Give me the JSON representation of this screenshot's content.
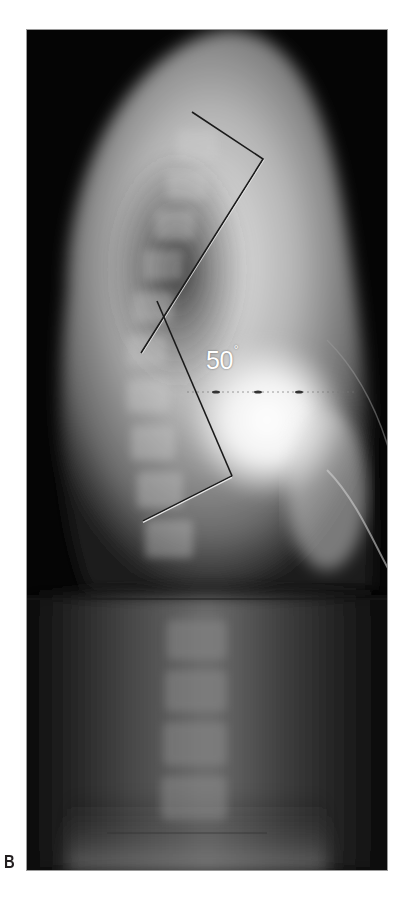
{
  "figure": {
    "panel_label": "B",
    "image_type": "lateral spine radiograph",
    "annotation": {
      "angle_value": "50",
      "angle_unit": "°",
      "measurement": "Cobb angle (kyphosis)"
    },
    "colors": {
      "background": "#ffffff",
      "film": "#050505",
      "measure_line_dark": "#1a1a1a",
      "measure_line_light": "#e8e8e8",
      "label_text": "#231f20"
    }
  }
}
